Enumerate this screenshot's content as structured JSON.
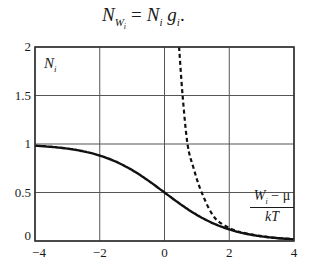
{
  "formula": {
    "lhs_main": "N",
    "lhs_sub": "W",
    "lhs_subsub": "i",
    "equals": "=",
    "rhs_n": "N",
    "rhs_n_sub": "i",
    "rhs_g": "g",
    "rhs_g_sub": "i",
    "end": "."
  },
  "y_label": {
    "main": "N",
    "sub": "i"
  },
  "x_label": {
    "num_main": "W",
    "num_sub": "i",
    "num_op": " − μ",
    "den": "kT"
  },
  "chart_data": {
    "type": "line",
    "xlabel": "(W_i − μ)/kT",
    "ylabel": "N_i",
    "xlim": [
      -4,
      4
    ],
    "ylim": [
      0,
      2
    ],
    "xticks": [
      -4,
      -2,
      0,
      2,
      4
    ],
    "xtick_labels": [
      "−4",
      "−2",
      "0",
      "2",
      "4"
    ],
    "yticks": [
      0,
      0.5,
      1,
      1.5,
      2
    ],
    "ytick_labels": [
      "0",
      "0.5",
      "1",
      "1.5",
      "2"
    ],
    "grid": true,
    "legend": null,
    "series": [
      {
        "name": "Fermi–Dirac (solid)",
        "style": "solid",
        "x": [
          -4,
          -3.5,
          -3,
          -2.5,
          -2,
          -1.5,
          -1,
          -0.5,
          0,
          0.5,
          1,
          1.5,
          2,
          2.5,
          3,
          3.5,
          4
        ],
        "y": [
          0.982,
          0.971,
          0.953,
          0.924,
          0.881,
          0.818,
          0.731,
          0.622,
          0.5,
          0.378,
          0.269,
          0.182,
          0.119,
          0.076,
          0.047,
          0.029,
          0.018
        ]
      },
      {
        "name": "Boltzmann-type (dashed)",
        "style": "dashed",
        "x": [
          0.45,
          0.56,
          0.71,
          0.9,
          1.15,
          1.55,
          2.1,
          2.5,
          3,
          3.5,
          4
        ],
        "y": [
          2.0,
          1.5,
          1.0,
          0.75,
          0.5,
          0.24,
          0.12,
          0.08,
          0.05,
          0.03,
          0.02
        ]
      }
    ]
  }
}
